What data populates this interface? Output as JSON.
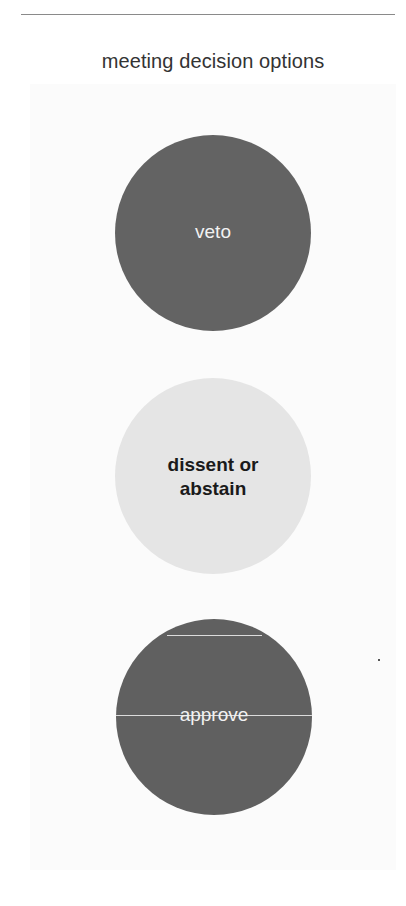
{
  "diagram": {
    "title": "meeting decision options",
    "options": [
      {
        "label": "veto",
        "fill": "#636363",
        "text_color": "#f2f2f2"
      },
      {
        "label": "dissent or abstain",
        "line1": "dissent or",
        "line2": "abstain",
        "fill": "#e5e5e5",
        "text_color": "#1a1a1a"
      },
      {
        "label": "approve",
        "fill": "#606060",
        "text_color": "#f2f2f2"
      }
    ]
  }
}
